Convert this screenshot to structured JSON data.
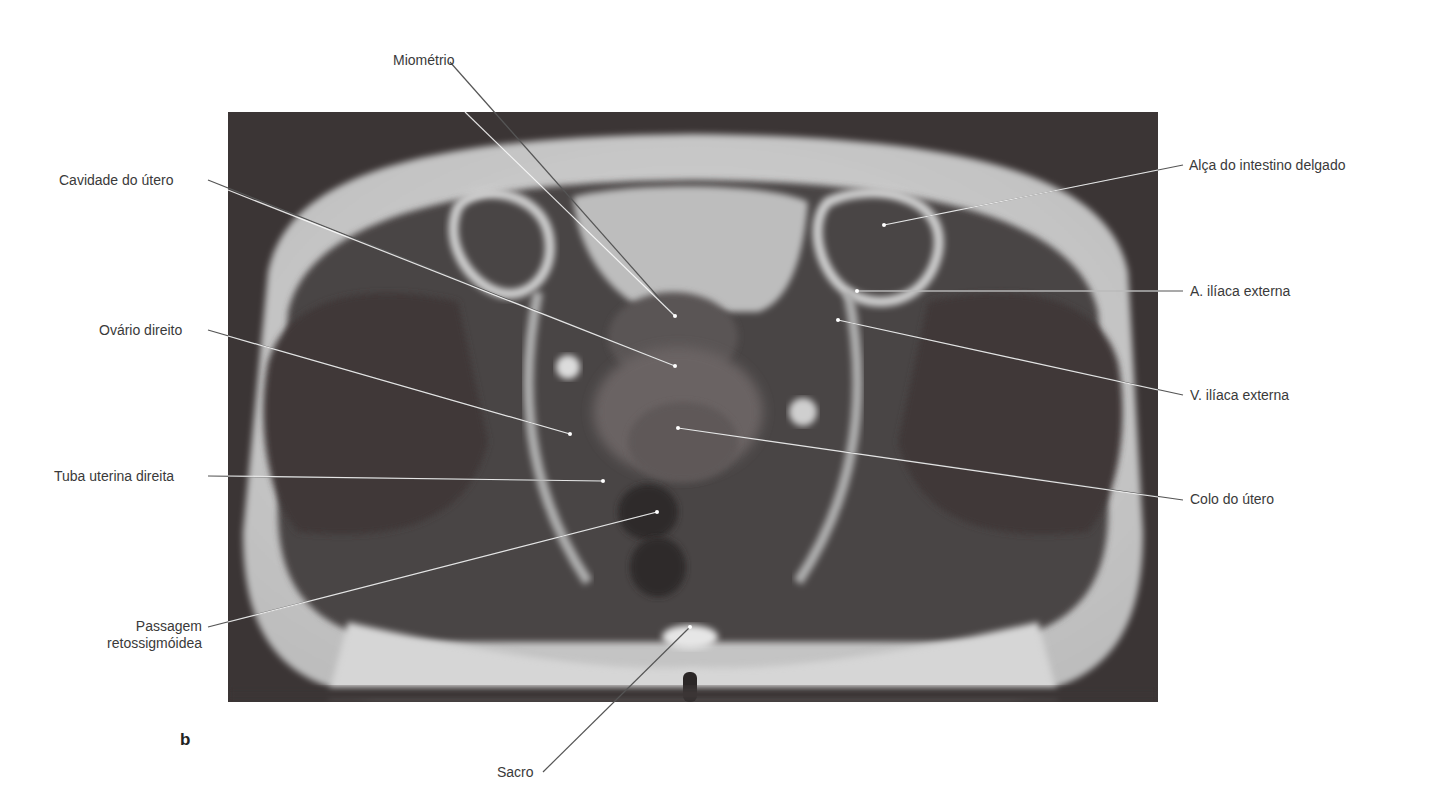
{
  "figure": {
    "panel_letter": "b",
    "image_description": "Axial T2-weighted MRI of female pelvis",
    "labels": {
      "miometrio": "Miométrio",
      "cavidade_utero": "Cavidade do útero",
      "ovario_direito": "Ovário direito",
      "tuba_uterina_direita": "Tuba uterina direita",
      "passagem_line1": "Passagem",
      "passagem_line2": "retossigmóidea",
      "sacro": "Sacro",
      "alca_intestino": "Alça do intestino delgado",
      "a_iliaca_externa": "A. ilíaca externa",
      "v_iliaca_externa": "V. ilíaca externa",
      "colo_utero": "Colo do útero"
    }
  }
}
